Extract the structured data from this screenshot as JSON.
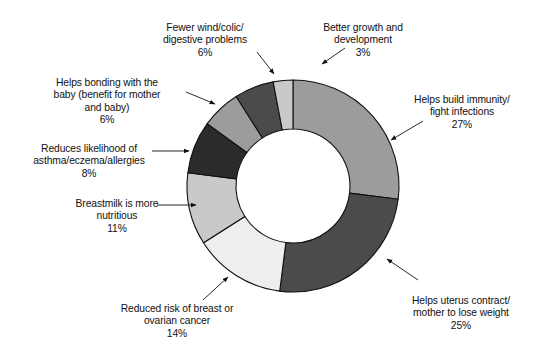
{
  "chart_data": {
    "type": "pie",
    "variant": "donut",
    "title": "",
    "subtitle": "",
    "xlabel": "",
    "ylabel": "",
    "grid": false,
    "legend_position": "none",
    "label_format": "category + percent",
    "units": "%",
    "total": 100,
    "start_angle_deg": 0,
    "direction": "clockwise",
    "inner_radius_ratio": 0.54,
    "categories": [
      "Helps build immunity/\nfight infections",
      "Helps uterus contract/\nmother to lose weight",
      "Reduced risk of breast or\novarian cancer",
      "Breastmilk is more\nnutritious",
      "Reduces likelihood of\nasthma/eczema/allergies",
      "Helps bonding with the\nbaby (benefit for mother\nand baby)",
      "Fewer wind/colic/\ndigestive problems",
      "Better growth and\ndevelopment"
    ],
    "values": [
      27,
      25,
      14,
      11,
      8,
      6,
      6,
      3
    ],
    "value_labels": [
      "27%",
      "25%",
      "14%",
      "11%",
      "8%",
      "6%",
      "6%",
      "3%"
    ],
    "colors": [
      "#9c9c9c",
      "#4b4b4b",
      "#eeeef0",
      "#c9c9c9",
      "#2b2b2b",
      "#9c9c9c",
      "#4b4b4b",
      "#c9c9c9"
    ],
    "stroke_color": "#111111",
    "background": "#ffffff",
    "series": [
      {
        "name": "Perceived benefits of breastfeeding",
        "values": [
          27,
          25,
          14,
          11,
          8,
          6,
          6,
          3
        ]
      }
    ]
  },
  "labels": {
    "immunity": {
      "text": "Helps build immunity/\nfight infections",
      "pct": "27%"
    },
    "uterus": {
      "text": "Helps uterus contract/\nmother to lose weight",
      "pct": "25%"
    },
    "cancer": {
      "text": "Reduced risk of breast or\novarian cancer",
      "pct": "14%"
    },
    "nutritious": {
      "text": "Breastmilk is more\nnutritious",
      "pct": "11%"
    },
    "asthma": {
      "text": "Reduces likelihood of\nasthma/eczema/allergies",
      "pct": "8%"
    },
    "bonding": {
      "text": "Helps bonding with the\nbaby (benefit for mother\nand baby)",
      "pct": "6%"
    },
    "wind": {
      "text": "Fewer wind/colic/\ndigestive problems",
      "pct": "6%"
    },
    "growth": {
      "text": "Better growth and\ndevelopment",
      "pct": "3%"
    }
  }
}
